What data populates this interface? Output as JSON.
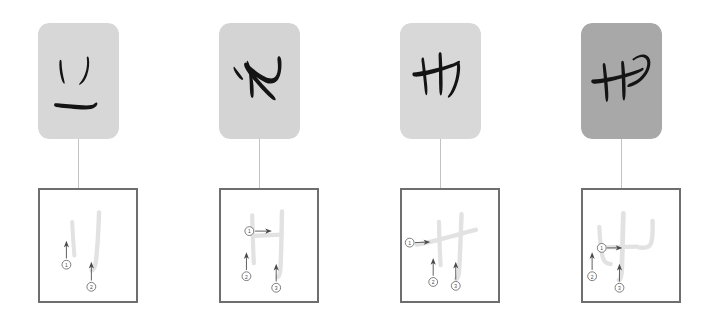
{
  "figure": {
    "panel_count": 4,
    "background_color": "#ffffff",
    "box_border_color": "#6e6e6e",
    "connector_color": "#c2c2c2",
    "stroke_trace_color": "#e2e2e2",
    "arrow_color": "#4a4a4a",
    "ink_color": "#141414"
  },
  "panels": [
    {
      "id": "panel-1",
      "thumbnail": {
        "name": "handwritten-character-1",
        "background_color": "#d7d7d7",
        "character_label": "こ",
        "ink_color": "#141414"
      },
      "stroke_box": {
        "name": "stroke-order-box-1",
        "stroke_count": 2,
        "strokes": [
          {
            "order": "1",
            "direction": "up",
            "arrow_label": "1"
          },
          {
            "order": "2",
            "direction": "up",
            "arrow_label": "2"
          }
        ]
      }
    },
    {
      "id": "panel-2",
      "thumbnail": {
        "name": "handwritten-character-2",
        "background_color": "#d4d4d4",
        "character_label": "や",
        "ink_color": "#141414"
      },
      "stroke_box": {
        "name": "stroke-order-box-2",
        "stroke_count": 3,
        "strokes": [
          {
            "order": "1",
            "direction": "right",
            "arrow_label": "1"
          },
          {
            "order": "2",
            "direction": "up",
            "arrow_label": "2"
          },
          {
            "order": "3",
            "direction": "up",
            "arrow_label": "3"
          }
        ]
      }
    },
    {
      "id": "panel-3",
      "thumbnail": {
        "name": "handwritten-character-3",
        "background_color": "#d8d8d8",
        "character_label": "サ",
        "ink_color": "#141414"
      },
      "stroke_box": {
        "name": "stroke-order-box-3",
        "stroke_count": 3,
        "strokes": [
          {
            "order": "1",
            "direction": "right",
            "arrow_label": "1"
          },
          {
            "order": "2",
            "direction": "up",
            "arrow_label": "2"
          },
          {
            "order": "3",
            "direction": "up",
            "arrow_label": "3"
          }
        ]
      }
    },
    {
      "id": "panel-4",
      "thumbnail": {
        "name": "handwritten-character-4",
        "background_color": "#a8a8a8",
        "character_label": "せ",
        "ink_color": "#141414"
      },
      "stroke_box": {
        "name": "stroke-order-box-4",
        "stroke_count": 3,
        "strokes": [
          {
            "order": "1",
            "direction": "right",
            "arrow_label": "1"
          },
          {
            "order": "2",
            "direction": "up",
            "arrow_label": "2"
          },
          {
            "order": "3",
            "direction": "up",
            "arrow_label": "3"
          }
        ]
      }
    }
  ]
}
